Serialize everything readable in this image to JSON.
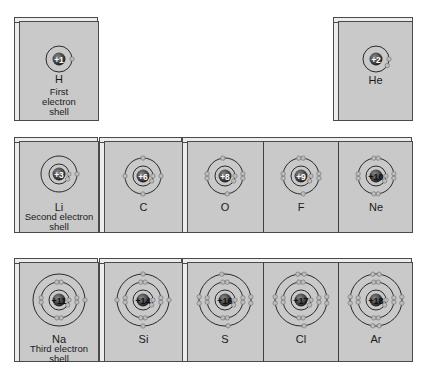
{
  "colors": {
    "panel": "#c9c9c9",
    "panel_edge": "#ececec",
    "orbit": "#2a2a2a",
    "electron": "#bdbdbd",
    "nucleus": "#1e1e1e",
    "nucleus_text": "#ffffff"
  },
  "rows": [
    {
      "caption": "First electron shell",
      "elements": [
        {
          "symbol": "H",
          "charge": "+1",
          "shells": [
            1
          ]
        },
        {
          "symbol": "He",
          "charge": "+2",
          "shells": [
            2
          ]
        }
      ]
    },
    {
      "caption": "Second electron shell",
      "elements": [
        {
          "symbol": "Li",
          "charge": "+3",
          "shells": [
            2,
            1
          ]
        },
        {
          "symbol": "C",
          "charge": "+6",
          "shells": [
            2,
            4
          ]
        },
        {
          "symbol": "O",
          "charge": "+8",
          "shells": [
            2,
            6
          ]
        },
        {
          "symbol": "F",
          "charge": "+9",
          "shells": [
            2,
            7
          ]
        },
        {
          "symbol": "Ne",
          "charge": "+10",
          "shells": [
            2,
            8
          ]
        }
      ]
    },
    {
      "caption": "Third electron shell",
      "elements": [
        {
          "symbol": "Na",
          "charge": "+11",
          "shells": [
            2,
            8,
            1
          ]
        },
        {
          "symbol": "Si",
          "charge": "+14",
          "shells": [
            2,
            8,
            4
          ]
        },
        {
          "symbol": "S",
          "charge": "+16",
          "shells": [
            2,
            8,
            6
          ]
        },
        {
          "symbol": "Cl",
          "charge": "+17",
          "shells": [
            2,
            8,
            7
          ]
        },
        {
          "symbol": "Ar",
          "charge": "+18",
          "shells": [
            2,
            8,
            8
          ]
        }
      ]
    }
  ]
}
